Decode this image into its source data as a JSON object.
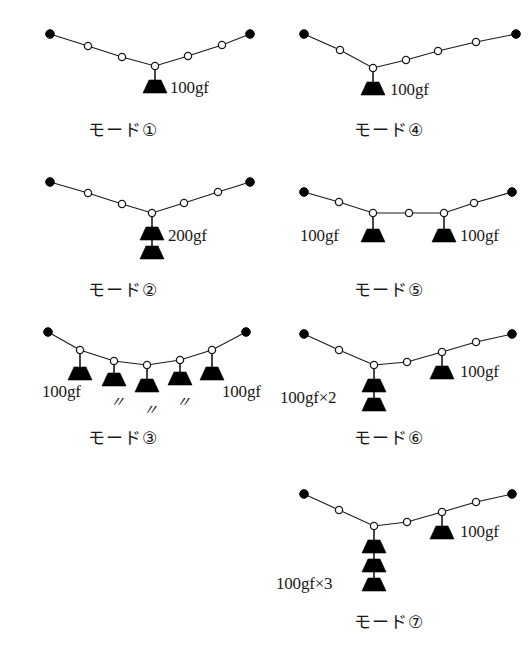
{
  "figure": {
    "background": "#ffffff",
    "ink": "#1a1a1a",
    "units": "gf"
  },
  "modes": [
    {
      "id": "mode-1",
      "caption": "モード①",
      "caption_x": 88,
      "caption_y": 116,
      "origin": [
        0,
        0
      ],
      "anchors": [
        [
          50,
          34
        ],
        [
          216,
          34
        ]
      ],
      "joints": [
        [
          88,
          46
        ],
        [
          122,
          57
        ],
        [
          155,
          66
        ],
        [
          188,
          56
        ],
        [
          216,
          34
        ]
      ],
      "cable": [
        [
          50,
          34
        ],
        [
          88,
          46
        ],
        [
          122,
          57
        ],
        [
          155,
          66
        ],
        [
          188,
          56
        ],
        [
          222,
          45
        ],
        [
          250,
          34
        ]
      ],
      "anchor_points": [
        [
          50,
          34
        ],
        [
          250,
          34
        ]
      ],
      "joint_points": [
        [
          88,
          46
        ],
        [
          122,
          57
        ],
        [
          155,
          66
        ],
        [
          188,
          56
        ],
        [
          222,
          45
        ]
      ],
      "loads": [
        {
          "joint": [
            155,
            66
          ],
          "stack": 1,
          "string": 14,
          "label": "100gf",
          "label_x": 170,
          "label_y": 78,
          "label_align": "left"
        }
      ]
    },
    {
      "id": "mode-2",
      "caption": "モード②",
      "caption_x": 88,
      "caption_y": 276,
      "origin": [
        0,
        160
      ],
      "anchor_points": [
        [
          50,
          22
        ],
        [
          250,
          22
        ]
      ],
      "joint_points": [
        [
          88,
          33
        ],
        [
          122,
          44
        ],
        [
          152,
          53
        ],
        [
          184,
          43
        ],
        [
          218,
          32
        ]
      ],
      "cable": [
        [
          50,
          22
        ],
        [
          88,
          33
        ],
        [
          122,
          44
        ],
        [
          152,
          53
        ],
        [
          184,
          43
        ],
        [
          218,
          32
        ],
        [
          250,
          22
        ]
      ],
      "loads": [
        {
          "joint": [
            152,
            53
          ],
          "stack": 2,
          "string": 14,
          "label": "200gf",
          "label_x": 168,
          "label_y": 66,
          "label_align": "left"
        }
      ]
    },
    {
      "id": "mode-3",
      "caption": "モード③",
      "caption_x": 88,
      "caption_y": 424,
      "origin": [
        0,
        310
      ],
      "anchor_points": [
        [
          48,
          22
        ],
        [
          246,
          22
        ]
      ],
      "joint_points": [
        [
          80,
          40
        ],
        [
          114,
          51
        ],
        [
          147,
          55
        ],
        [
          180,
          50
        ],
        [
          212,
          40
        ]
      ],
      "cable": [
        [
          48,
          22
        ],
        [
          80,
          40
        ],
        [
          114,
          51
        ],
        [
          147,
          55
        ],
        [
          180,
          50
        ],
        [
          212,
          40
        ],
        [
          246,
          22
        ]
      ],
      "loads": [
        {
          "joint": [
            80,
            40
          ],
          "stack": 1,
          "string": 17,
          "label": "100gf",
          "label_x": 42,
          "label_y": 72,
          "label_align": "left"
        },
        {
          "joint": [
            114,
            51
          ],
          "stack": 1,
          "string": 12,
          "label": "〃",
          "label_x": 110,
          "label_y": 80,
          "label_align": "center",
          "ditto": true
        },
        {
          "joint": [
            147,
            55
          ],
          "stack": 1,
          "string": 14,
          "label": "〃",
          "label_x": 143,
          "label_y": 88,
          "label_align": "center",
          "ditto": true
        },
        {
          "joint": [
            180,
            50
          ],
          "stack": 1,
          "string": 12,
          "label": "〃",
          "label_x": 176,
          "label_y": 80,
          "label_align": "center",
          "ditto": true
        },
        {
          "joint": [
            212,
            40
          ],
          "stack": 1,
          "string": 17,
          "label": "100gf",
          "label_x": 222,
          "label_y": 72,
          "label_align": "left"
        }
      ]
    },
    {
      "id": "mode-4",
      "caption": "モード④",
      "caption_x": 354,
      "caption_y": 116,
      "origin": [
        266,
        0
      ],
      "anchor_points": [
        [
          38,
          34
        ],
        [
          250,
          34
        ]
      ],
      "joint_points": [
        [
          74,
          50
        ],
        [
          107,
          68
        ],
        [
          140,
          60
        ],
        [
          172,
          51
        ],
        [
          210,
          42
        ]
      ],
      "cable": [
        [
          38,
          34
        ],
        [
          74,
          50
        ],
        [
          107,
          68
        ],
        [
          140,
          60
        ],
        [
          172,
          51
        ],
        [
          210,
          42
        ],
        [
          250,
          34
        ]
      ],
      "loads": [
        {
          "joint": [
            107,
            68
          ],
          "stack": 1,
          "string": 14,
          "label": "100gf",
          "label_x": 124,
          "label_y": 80,
          "label_align": "left"
        }
      ]
    },
    {
      "id": "mode-5",
      "caption": "モード⑤",
      "caption_x": 354,
      "caption_y": 276,
      "origin": [
        266,
        160
      ],
      "anchor_points": [
        [
          38,
          32
        ],
        [
          246,
          32
        ]
      ],
      "joint_points": [
        [
          73,
          42
        ],
        [
          107,
          53
        ],
        [
          143,
          53
        ],
        [
          178,
          53
        ],
        [
          208,
          43
        ]
      ],
      "cable": [
        [
          38,
          32
        ],
        [
          73,
          42
        ],
        [
          107,
          53
        ],
        [
          143,
          53
        ],
        [
          178,
          53
        ],
        [
          208,
          43
        ],
        [
          246,
          32
        ]
      ],
      "loads": [
        {
          "joint": [
            107,
            53
          ],
          "stack": 1,
          "string": 16,
          "label": "100gf",
          "label_x": 34,
          "label_y": 66,
          "label_align": "left"
        },
        {
          "joint": [
            178,
            53
          ],
          "stack": 1,
          "string": 16,
          "label": "100gf",
          "label_x": 194,
          "label_y": 66,
          "label_align": "left"
        }
      ]
    },
    {
      "id": "mode-6",
      "caption": "モード⑥",
      "caption_x": 354,
      "caption_y": 424,
      "origin": [
        266,
        310
      ],
      "anchor_points": [
        [
          38,
          24
        ],
        [
          246,
          24
        ]
      ],
      "joint_points": [
        [
          73,
          40
        ],
        [
          108,
          55
        ],
        [
          141,
          52
        ],
        [
          176,
          42
        ],
        [
          210,
          32
        ]
      ],
      "cable": [
        [
          38,
          24
        ],
        [
          73,
          40
        ],
        [
          108,
          55
        ],
        [
          141,
          52
        ],
        [
          176,
          42
        ],
        [
          210,
          32
        ],
        [
          246,
          24
        ]
      ],
      "loads": [
        {
          "joint": [
            108,
            55
          ],
          "stack": 2,
          "string": 14,
          "label": "100gf×2",
          "label_x": 14,
          "label_y": 78,
          "label_align": "left"
        },
        {
          "joint": [
            176,
            42
          ],
          "stack": 1,
          "string": 14,
          "label": "100gf",
          "label_x": 194,
          "label_y": 52,
          "label_align": "left"
        }
      ]
    },
    {
      "id": "mode-7",
      "caption": "モード⑦",
      "caption_x": 354,
      "caption_y": 608,
      "origin": [
        266,
        470
      ],
      "anchor_points": [
        [
          38,
          24
        ],
        [
          246,
          24
        ]
      ],
      "joint_points": [
        [
          73,
          40
        ],
        [
          108,
          56
        ],
        [
          141,
          52
        ],
        [
          176,
          42
        ],
        [
          210,
          32
        ]
      ],
      "cable": [
        [
          38,
          24
        ],
        [
          73,
          40
        ],
        [
          108,
          56
        ],
        [
          141,
          52
        ],
        [
          176,
          42
        ],
        [
          210,
          32
        ],
        [
          246,
          24
        ]
      ],
      "loads": [
        {
          "joint": [
            108,
            56
          ],
          "stack": 3,
          "string": 14,
          "label": "100gf×3",
          "label_x": 10,
          "label_y": 104,
          "label_align": "left"
        },
        {
          "joint": [
            176,
            42
          ],
          "stack": 1,
          "string": 14,
          "label": "100gf",
          "label_x": 194,
          "label_y": 52,
          "label_align": "left"
        }
      ]
    }
  ]
}
